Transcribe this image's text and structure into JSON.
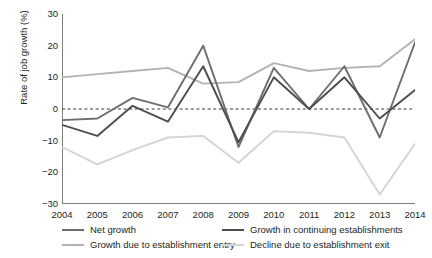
{
  "chart_data": {
    "type": "line",
    "title": "",
    "xlabel": "",
    "ylabel": "Rate of job growth (%)",
    "categories": [
      "2004",
      "2005",
      "2006",
      "2007",
      "2008",
      "2009",
      "2010",
      "2011",
      "2012",
      "2013",
      "2014"
    ],
    "x": [
      2004,
      2005,
      2006,
      2007,
      2008,
      2009,
      2010,
      2011,
      2012,
      2013,
      2014
    ],
    "ylim": [
      -30,
      30
    ],
    "yticks": [
      30,
      20,
      10,
      0,
      -10,
      -20,
      -30
    ],
    "ytick_labels": [
      "30",
      "20",
      "10",
      "0",
      "−10",
      "−20",
      "−30"
    ],
    "grid": false,
    "zero_line": true,
    "zero_line_style": "dashed",
    "legend_position": "below",
    "series": [
      {
        "name": "Net growth",
        "color": "#6e6e6e",
        "values": [
          -3.5,
          -3.0,
          3.5,
          0.5,
          20.0,
          -12.0,
          13.0,
          0.0,
          13.5,
          -9.0,
          21.0
        ]
      },
      {
        "name": "Growth in continuing establishments",
        "color": "#4d4d4d",
        "values": [
          -5.0,
          -8.5,
          1.0,
          -4.0,
          13.5,
          -10.5,
          10.0,
          0.0,
          10.0,
          -3.0,
          6.0
        ]
      },
      {
        "name": "Growth due to establishment entry",
        "color": "#b3b3b3",
        "values": [
          10.0,
          11.0,
          12.0,
          13.0,
          8.0,
          8.5,
          14.5,
          12.0,
          13.0,
          13.5,
          22.0
        ]
      },
      {
        "name": "Decline due to establishment exit",
        "color": "#d4d4d4",
        "values": [
          -12.0,
          -17.5,
          -13.0,
          -9.0,
          -8.5,
          -17.0,
          -7.0,
          -7.5,
          -9.0,
          -27.0,
          -11.0
        ]
      }
    ]
  },
  "legend": {
    "items": [
      {
        "label": "Net growth",
        "color": "#6e6e6e"
      },
      {
        "label": "Growth in continuing establishments",
        "color": "#4d4d4d"
      },
      {
        "label": "Growth due to establishment entry",
        "color": "#b3b3b3"
      },
      {
        "label": "Decline due to establishment exit",
        "color": "#d4d4d4"
      }
    ]
  },
  "axes": {
    "axis_color": "#808080",
    "zero_line_color": "#3a3a3a"
  }
}
